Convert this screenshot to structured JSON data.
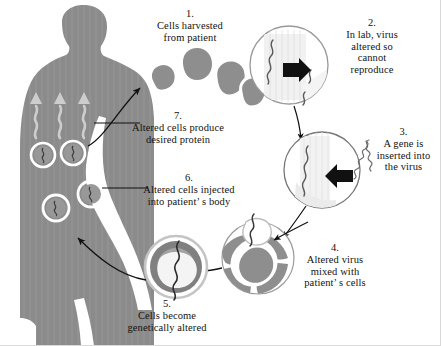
{
  "figure": {
    "subject_label": "patient-silhouette",
    "background_color": "#ffffff",
    "body_color": "#8c8c8c",
    "ink_color": "#14120f"
  },
  "steps": [
    {
      "id": "step1",
      "number": "1.",
      "lines": [
        "Cells harvested",
        "from patient"
      ],
      "graphic": "cell-cluster"
    },
    {
      "id": "step2",
      "number": "2.",
      "lines": [
        "In lab, virus",
        "altered so",
        "cannot",
        "reproduce"
      ],
      "graphic": "virus-circle-altered"
    },
    {
      "id": "step3",
      "number": "3.",
      "lines": [
        "A gene is",
        "inserted into",
        "the virus"
      ],
      "graphic": "virus-circle-gene-insert"
    },
    {
      "id": "step4",
      "number": "4.",
      "lines": [
        "Altered virus",
        "mixed with",
        "patient’ s cells"
      ],
      "graphic": "cell-with-virus"
    },
    {
      "id": "step5",
      "number": "5.",
      "lines": [
        "Cells become",
        "genetically altered"
      ],
      "graphic": "altered-cell"
    },
    {
      "id": "step6",
      "number": "6.",
      "lines": [
        "Altered cells injected",
        "into patient’ s body"
      ],
      "graphic": "injection-leader-line"
    },
    {
      "id": "step7",
      "number": "7.",
      "lines": [
        "Altered cells produce",
        "desired protein"
      ],
      "graphic": "protein-waves"
    }
  ],
  "graphics": {
    "cell_cluster_count": 5,
    "body_cells_count": 4,
    "protein_wave_count": 3,
    "arrow_color": "#111111",
    "cell_fill": "#8e8e8e",
    "cell_outline": "#ffffff",
    "circle_outline": "#777777"
  }
}
